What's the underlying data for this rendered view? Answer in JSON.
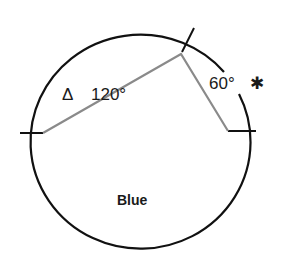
{
  "diagram": {
    "type": "circle-sector-diagram",
    "colors": {
      "circle": "#111111",
      "radii": "#8a8a8a",
      "text": "#1a1a1a",
      "background": "#ffffff"
    },
    "sectors": [
      {
        "marker": "Δ",
        "angle_label": "120°",
        "angle": 120
      },
      {
        "marker": "✱",
        "angle_label": "60°",
        "angle": 60
      }
    ],
    "region_label": "Blue"
  }
}
